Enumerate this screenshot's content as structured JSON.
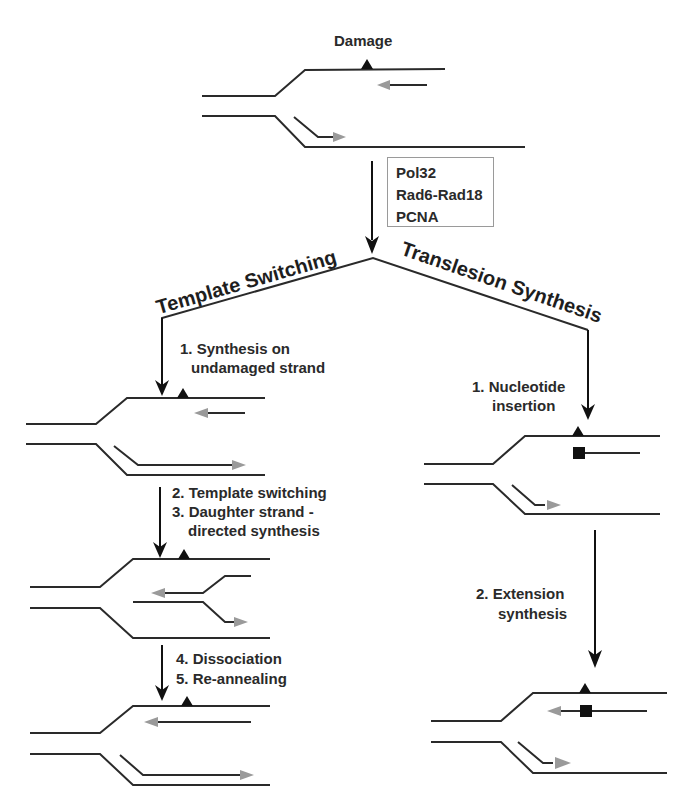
{
  "diagram": {
    "top": {
      "damage_label": "Damage",
      "factors": [
        "Pol32",
        "Rad6-Rad18",
        "PCNA"
      ]
    },
    "pathways": {
      "left_title": "Template Switching",
      "right_title": "Translesion Synthesis"
    },
    "template_switching": {
      "steps": [
        {
          "label_line1": "1. Synthesis on",
          "label_line2": "undamaged strand"
        },
        {
          "label_line1": "2. Template switching",
          "label_line2": "3. Daughter strand -",
          "label_line3": "directed synthesis"
        },
        {
          "label_line1": "4. Dissociation",
          "label_line2": "5. Re-annealing"
        }
      ]
    },
    "translesion_synthesis": {
      "steps": [
        {
          "label_line1": "1. Nucleotide",
          "label_line2": "insertion"
        },
        {
          "label_line1": "2. Extension",
          "label_line2": "synthesis"
        }
      ]
    },
    "legend_symbols": {
      "damage_marker": "triangle",
      "inserted_nucleotide": "square",
      "nascent_strand_color": "#9a9a9a",
      "template_strand_color": "#2a2a2a"
    }
  }
}
